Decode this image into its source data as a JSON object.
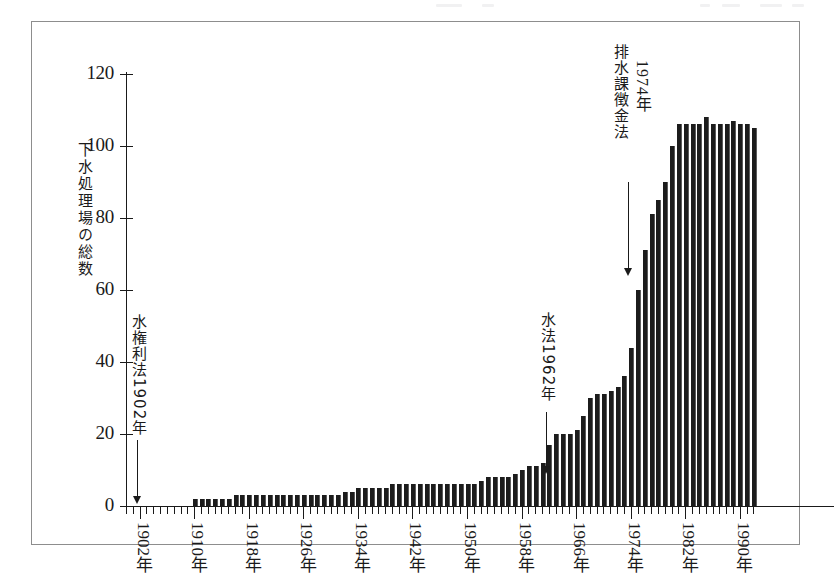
{
  "figure": {
    "y_axis_title": "下水処理場の総数",
    "y_ticks": [
      0,
      20,
      40,
      60,
      80,
      100,
      120
    ],
    "x_tick_labels": [
      "1902年",
      "1910年",
      "1918年",
      "1926年",
      "1934年",
      "1942年",
      "1950年",
      "1958年",
      "1966年",
      "1974年",
      "1982年",
      "1990年"
    ],
    "x_tick_years": [
      1902,
      1910,
      1918,
      1926,
      1934,
      1942,
      1950,
      1958,
      1966,
      1974,
      1982,
      1990
    ],
    "annotations": [
      {
        "name": "water-rights-act",
        "line1": "水権利法1902年",
        "line2": "",
        "year": 1902,
        "value": 0
      },
      {
        "name": "water-act",
        "line1": "水法1962年",
        "line2": "",
        "year": 1962,
        "value": 17
      },
      {
        "name": "wastewater-levy-act",
        "line1": "排水課徴金法",
        "line2": "1974年",
        "year": 1974,
        "value": 60
      }
    ],
    "colors": {
      "bar": "#1c1c1c",
      "axis": "#1a1a1a",
      "frame": "#8d8d8d",
      "background": "#ffffff"
    }
  },
  "chart_data": {
    "type": "bar",
    "title": "",
    "xlabel": "",
    "ylabel": "下水処理場の総数",
    "ylim": [
      0,
      120
    ],
    "xlim": [
      1900,
      1993
    ],
    "grid": false,
    "legend": "none",
    "categories": [
      "1900年",
      "1901年",
      "1902年",
      "1903年",
      "1904年",
      "1905年",
      "1906年",
      "1907年",
      "1908年",
      "1909年",
      "1910年",
      "1911年",
      "1912年",
      "1913年",
      "1914年",
      "1915年",
      "1916年",
      "1917年",
      "1918年",
      "1919年",
      "1920年",
      "1921年",
      "1922年",
      "1923年",
      "1924年",
      "1925年",
      "1926年",
      "1927年",
      "1928年",
      "1929年",
      "1930年",
      "1931年",
      "1932年",
      "1933年",
      "1934年",
      "1935年",
      "1936年",
      "1937年",
      "1938年",
      "1939年",
      "1940年",
      "1941年",
      "1942年",
      "1943年",
      "1944年",
      "1945年",
      "1946年",
      "1947年",
      "1948年",
      "1949年",
      "1950年",
      "1951年",
      "1952年",
      "1953年",
      "1954年",
      "1955年",
      "1956年",
      "1957年",
      "1958年",
      "1959年",
      "1960年",
      "1961年",
      "1962年",
      "1963年",
      "1964年",
      "1965年",
      "1966年",
      "1967年",
      "1968年",
      "1969年",
      "1970年",
      "1971年",
      "1972年",
      "1973年",
      "1974年",
      "1975年",
      "1976年",
      "1977年",
      "1978年",
      "1979年",
      "1980年",
      "1981年",
      "1982年",
      "1983年",
      "1984年",
      "1985年",
      "1986年",
      "1987年",
      "1988年",
      "1989年",
      "1990年",
      "1991年",
      "1992年"
    ],
    "values": [
      0,
      0,
      0,
      0,
      0,
      0,
      0,
      0,
      0,
      0,
      2,
      2,
      2,
      2,
      2,
      2,
      3,
      3,
      3,
      3,
      3,
      3,
      3,
      3,
      3,
      3,
      3,
      3,
      3,
      3,
      3,
      3,
      4,
      4,
      5,
      5,
      5,
      5,
      5,
      6,
      6,
      6,
      6,
      6,
      6,
      6,
      6,
      6,
      6,
      6,
      6,
      6,
      7,
      8,
      8,
      8,
      8,
      9,
      10,
      11,
      11,
      12,
      17,
      20,
      20,
      20,
      21,
      25,
      30,
      31,
      31,
      32,
      33,
      36,
      44,
      60,
      71,
      81,
      85,
      90,
      100,
      106,
      106,
      106,
      106,
      108,
      106,
      106,
      106,
      107,
      106,
      106,
      105
    ],
    "annotations": [
      {
        "text": "水権利法1902年",
        "x": "1902年",
        "y": 0
      },
      {
        "text": "水法1962年",
        "x": "1962年",
        "y": 17
      },
      {
        "text": "排水課徴金法 1974年",
        "x": "1974年",
        "y": 60
      }
    ]
  }
}
